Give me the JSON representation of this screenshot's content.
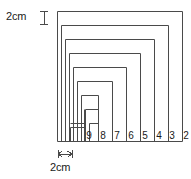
{
  "figure": {
    "kind": "geometry-diagram"
  },
  "measurements": {
    "vertical": {
      "label": "2cm",
      "value": 2,
      "unit": "cm",
      "marker": "i-beam-vertical-icon"
    },
    "horizontal": {
      "label": "2cm",
      "value": 2,
      "unit": "cm",
      "marker": "double-arrow-horizontal-icon"
    }
  },
  "stroke_color": "#4a4a4a",
  "text_color": "#1a1a1a",
  "background_color": "#ffffff",
  "bands": [
    {
      "index": 0,
      "label": "1"
    },
    {
      "index": 1,
      "label": "2"
    },
    {
      "index": 2,
      "label": "3"
    },
    {
      "index": 3,
      "label": "4"
    },
    {
      "index": 4,
      "label": "5"
    },
    {
      "index": 5,
      "label": "6"
    },
    {
      "index": 6,
      "label": "7"
    },
    {
      "index": 7,
      "label": "8"
    },
    {
      "index": 8,
      "label": "9"
    },
    {
      "index": 9,
      "label": ""
    }
  ]
}
